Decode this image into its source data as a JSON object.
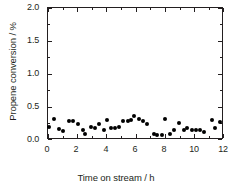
{
  "chart_data": {
    "type": "scatter",
    "title": "",
    "xlabel": "Time on stream / h",
    "ylabel": "Propene conversion / %",
    "xlim": [
      0,
      12
    ],
    "ylim": [
      0.0,
      2.0
    ],
    "xticks": [
      0,
      2,
      4,
      6,
      8,
      10,
      12
    ],
    "xtick_labels": [
      "0",
      "2",
      "4",
      "6",
      "8",
      "10",
      "12"
    ],
    "yticks": [
      0.0,
      0.5,
      1.0,
      1.5,
      2.0
    ],
    "ytick_labels": [
      "0.0",
      "0.5",
      "1.0",
      "1.5",
      "2.0"
    ],
    "grid": false,
    "legend": false,
    "marker": "filled-circle",
    "marker_color": "#000000",
    "axis_color": "#231f20",
    "background": "#ffffff",
    "series": [
      {
        "name": "Propene conversion",
        "x": [
          0.05,
          0.38,
          0.75,
          1.05,
          1.45,
          1.75,
          2.05,
          2.4,
          2.58,
          2.95,
          3.25,
          3.55,
          3.85,
          4.1,
          4.35,
          4.65,
          4.9,
          5.2,
          5.5,
          5.75,
          5.95,
          6.25,
          6.55,
          6.85,
          7.3,
          7.55,
          7.85,
          8.1,
          8.4,
          8.7,
          9.05,
          9.35,
          9.6,
          9.9,
          10.2,
          10.5,
          10.75,
          11.3,
          11.55,
          11.85
        ],
        "y": [
          0.17,
          0.3,
          0.14,
          0.11,
          0.26,
          0.26,
          0.22,
          0.12,
          0.06,
          0.17,
          0.15,
          0.21,
          0.12,
          0.28,
          0.16,
          0.15,
          0.17,
          0.26,
          0.26,
          0.28,
          0.34,
          0.3,
          0.26,
          0.22,
          0.06,
          0.05,
          0.05,
          0.29,
          0.06,
          0.13,
          0.23,
          0.13,
          0.15,
          0.13,
          0.13,
          0.13,
          0.1,
          0.27,
          0.16,
          0.25
        ]
      }
    ]
  }
}
